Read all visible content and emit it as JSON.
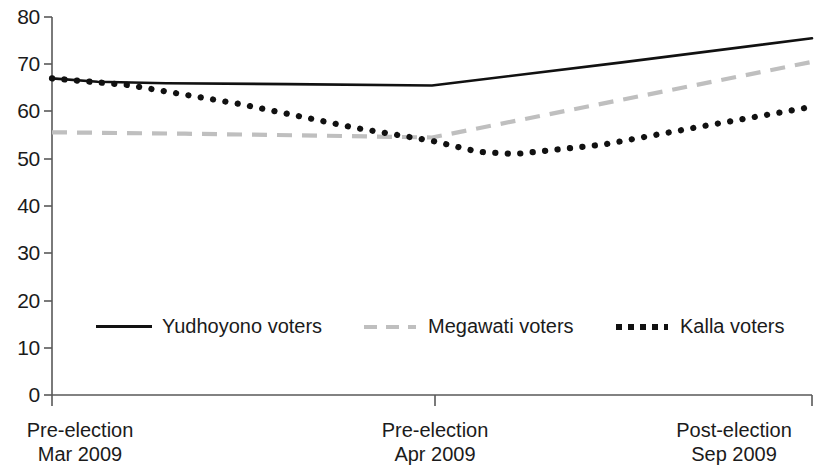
{
  "chart_data": {
    "type": "line",
    "title": "",
    "subtitle": "",
    "xlabel": "",
    "ylabel": "",
    "ylim": [
      0,
      80
    ],
    "yticks": [
      0,
      10,
      20,
      30,
      40,
      50,
      60,
      70,
      80
    ],
    "grid": false,
    "legend_position": "inside-bottom",
    "categories": [
      "Pre-election Mar 2009",
      "Pre-election Apr 2009",
      "Post-election Sep 2009"
    ],
    "x_tick_labels": [
      {
        "line1": "Pre-election",
        "line2": "Mar 2009"
      },
      {
        "line1": "Pre-election",
        "line2": "Apr 2009"
      },
      {
        "line1": "Post-election",
        "line2": "Sep 2009"
      }
    ],
    "series": [
      {
        "name": "Yudhoyono voters",
        "style": "solid",
        "color": "#111111",
        "values": [
          67,
          65.5,
          75.5
        ],
        "points": [
          {
            "x": 0.0,
            "y": 67.0
          },
          {
            "x": 0.12,
            "y": 66.3
          },
          {
            "x": 0.3,
            "y": 66.0
          },
          {
            "x": 0.62,
            "y": 65.8
          },
          {
            "x": 1.0,
            "y": 65.5
          },
          {
            "x": 1.5,
            "y": 70.4
          },
          {
            "x": 2.0,
            "y": 75.5
          }
        ]
      },
      {
        "name": "Megawati voters",
        "style": "dashed",
        "color": "#bfbfbf",
        "values": [
          55.5,
          54.5,
          70.5
        ],
        "points": [
          {
            "x": 0.0,
            "y": 55.6
          },
          {
            "x": 0.35,
            "y": 55.3
          },
          {
            "x": 0.7,
            "y": 54.9
          },
          {
            "x": 1.0,
            "y": 54.5
          },
          {
            "x": 1.5,
            "y": 62.5
          },
          {
            "x": 2.0,
            "y": 70.5
          }
        ]
      },
      {
        "name": "Kalla voters",
        "style": "dotted",
        "color": "#111111",
        "values": [
          67,
          51,
          61
        ],
        "points": [
          {
            "x": 0.0,
            "y": 67.0
          },
          {
            "x": 0.2,
            "y": 65.6
          },
          {
            "x": 0.5,
            "y": 61.5
          },
          {
            "x": 0.8,
            "y": 56.5
          },
          {
            "x": 1.0,
            "y": 53.8
          },
          {
            "x": 1.12,
            "y": 51.5
          },
          {
            "x": 1.22,
            "y": 51.0
          },
          {
            "x": 1.45,
            "y": 53.0
          },
          {
            "x": 1.72,
            "y": 57.0
          },
          {
            "x": 2.0,
            "y": 61.0
          }
        ]
      }
    ]
  },
  "legend": {
    "items": [
      {
        "label": "Yudhoyono voters",
        "style": "solid"
      },
      {
        "label": "Megawati voters",
        "style": "dashed"
      },
      {
        "label": "Kalla voters",
        "style": "dotted"
      }
    ]
  },
  "axis": {
    "y_tick_labels": [
      "80",
      "70",
      "60",
      "50",
      "40",
      "30",
      "20",
      "10",
      "0"
    ]
  },
  "colors": {
    "line_dark": "#111111",
    "line_gray": "#bfbfbf",
    "axis": "#595959",
    "text": "#1b1b1b",
    "background": "#ffffff"
  }
}
